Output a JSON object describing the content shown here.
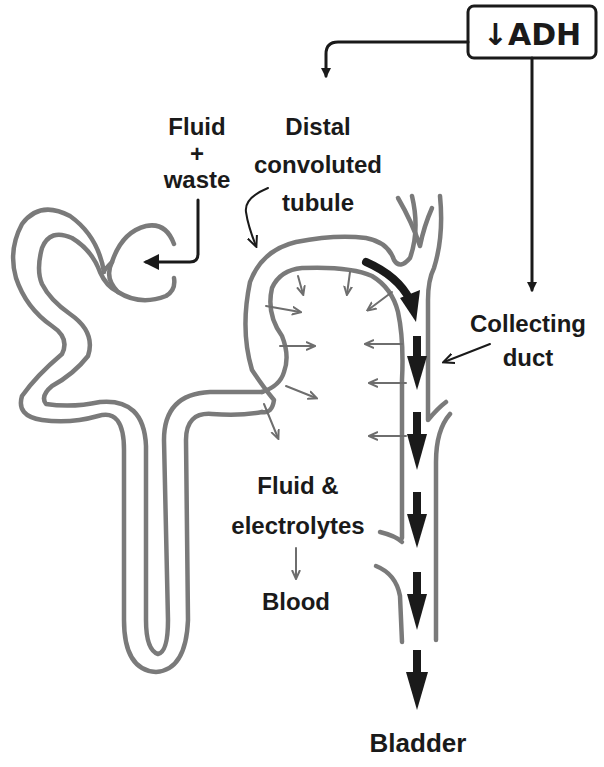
{
  "diagram": {
    "hormone_box": {
      "label": "↓ADH",
      "arrow_symbol": "↓",
      "hormone": "ADH"
    },
    "labels": {
      "fluid_waste": {
        "line1": "Fluid",
        "line2": "+",
        "line3": "waste"
      },
      "distal_tubule": {
        "line1": "Distal",
        "line2": "convoluted",
        "line3": "tubule"
      },
      "collecting_duct": {
        "line1": "Collecting",
        "line2": "duct"
      },
      "fluid_electrolytes": {
        "line1": "Fluid &",
        "line2": "electrolytes"
      },
      "blood": "Blood",
      "bladder": "Bladder"
    },
    "colors": {
      "tubule_outline": "#7a7a7a",
      "reabsorption_arrows": "#6e6e6e",
      "flow_arrows": "#1a1a1a",
      "background": "#ffffff"
    }
  }
}
